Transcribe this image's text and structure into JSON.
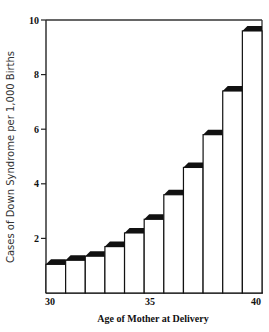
{
  "chart_data": {
    "type": "bar",
    "title": "",
    "xlabel": "Age of Mother at Delivery",
    "ylabel": "Cases of Down Syndrome per 1,000 Births",
    "categories": [
      "30",
      "31",
      "32",
      "33",
      "34",
      "35",
      "36",
      "37",
      "38",
      "39",
      "40"
    ],
    "values": [
      1.05,
      1.2,
      1.35,
      1.7,
      2.2,
      2.7,
      3.6,
      4.6,
      5.8,
      7.4,
      9.6
    ],
    "ylim": [
      0,
      10
    ],
    "yticks": [
      2,
      4,
      6,
      8,
      10
    ],
    "xtick_labels": [
      {
        "label": "30",
        "index": 0
      },
      {
        "label": "35",
        "index": 5
      },
      {
        "label": "40",
        "index": 10
      }
    ],
    "grid": false,
    "legend": null,
    "style": {
      "bar_fill": "#ffffff",
      "bar_stroke": "#111111",
      "bar_cap": "#111111",
      "frame": "#333333"
    }
  }
}
